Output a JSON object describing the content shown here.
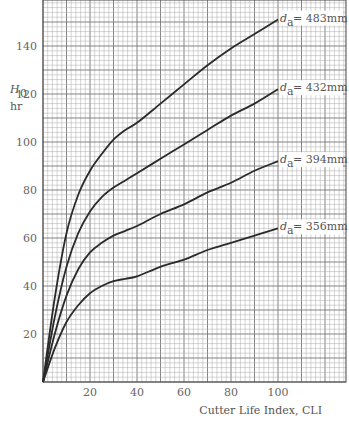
{
  "chart_data": {
    "type": "line",
    "title": "",
    "xlabel": "Cutter Life Index, CLI",
    "ylabel": "H_0 hr",
    "ylabel_main": "H",
    "ylabel_sub": "0",
    "ylabel_unit": "hr",
    "xlim": [
      0,
      130
    ],
    "ylim": [
      0,
      160
    ],
    "x_ticks": [
      20,
      40,
      60,
      80,
      100
    ],
    "y_ticks": [
      20,
      40,
      60,
      80,
      100,
      120,
      140
    ],
    "grid": true,
    "legend_position": "inline-right",
    "series": [
      {
        "name": "d_a = 483mm",
        "label_main": "d",
        "label_sub": "a",
        "label_value": "= 483mm",
        "x": [
          0,
          5,
          10,
          15,
          20,
          25,
          30,
          35,
          40,
          50,
          60,
          70,
          80,
          90,
          100
        ],
        "y": [
          0,
          35,
          62,
          78,
          88,
          95,
          101,
          105,
          108,
          116,
          124,
          132,
          139,
          145,
          151
        ]
      },
      {
        "name": "d_a = 432mm",
        "label_main": "d",
        "label_sub": "a",
        "label_value": "= 432mm",
        "x": [
          0,
          5,
          10,
          15,
          20,
          25,
          30,
          35,
          40,
          50,
          60,
          70,
          80,
          90,
          100
        ],
        "y": [
          0,
          27,
          48,
          62,
          71,
          77,
          81,
          84,
          87,
          93,
          99,
          105,
          111,
          116,
          122
        ]
      },
      {
        "name": "d_a = 394mm",
        "label_main": "d",
        "label_sub": "a",
        "label_value": "= 394mm",
        "x": [
          0,
          5,
          10,
          15,
          20,
          25,
          30,
          35,
          40,
          50,
          60,
          70,
          80,
          90,
          100
        ],
        "y": [
          0,
          20,
          36,
          47,
          54,
          58,
          61,
          63,
          65,
          70,
          74,
          79,
          83,
          88,
          92
        ]
      },
      {
        "name": "d_a = 356mm",
        "label_main": "d",
        "label_sub": "a",
        "label_value": "= 356mm",
        "x": [
          0,
          5,
          10,
          15,
          20,
          25,
          30,
          35,
          40,
          50,
          60,
          70,
          80,
          90,
          100
        ],
        "y": [
          0,
          14,
          25,
          32,
          37,
          40,
          42,
          43,
          44,
          48,
          51,
          55,
          58,
          61,
          64
        ]
      }
    ]
  }
}
